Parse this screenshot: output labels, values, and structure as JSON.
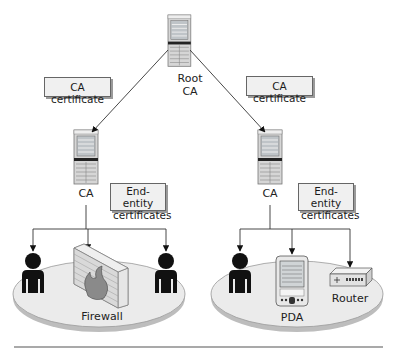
{
  "diagram": {
    "root": {
      "label_line1": "Root",
      "label_line2": "CA"
    },
    "left_branch": {
      "edge_label": "CA certificate",
      "ca_label": "CA",
      "end_entity_label_line1": "End-entity",
      "end_entity_label_line2": "certificates",
      "domain_items": [
        "User",
        "Firewall",
        "User"
      ],
      "device_label": "Firewall"
    },
    "right_branch": {
      "edge_label": "CA certificate",
      "ca_label": "CA",
      "end_entity_label_line1": "End-entity",
      "end_entity_label_line2": "certificates",
      "domain_items": [
        "User",
        "PDA",
        "Router"
      ],
      "pda_label": "PDA",
      "router_label": "Router"
    },
    "colors": {
      "line": "#333333",
      "label_bg": "#f0f0f0",
      "platform_fill": "#e6e6e6",
      "server_body": "#d8d8d8",
      "person": "#111111"
    }
  }
}
